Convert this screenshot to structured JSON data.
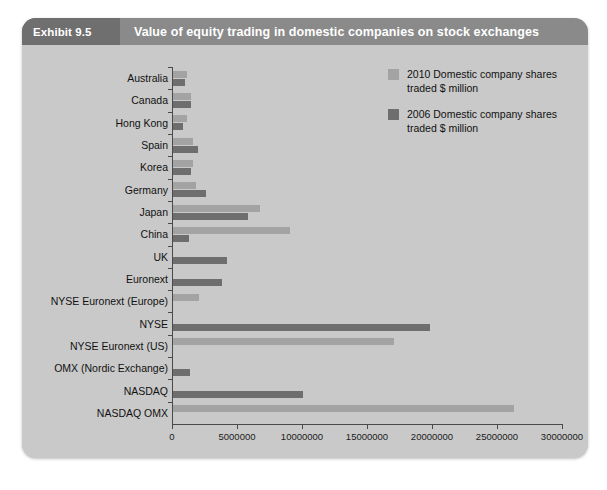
{
  "header": {
    "exhibit_label": "Exhibit 9.5",
    "title": "Value of equity trading in domestic companies on stock exchanges"
  },
  "legend": {
    "position": "top-right",
    "items": [
      {
        "label": "2010 Domestic company shares traded $ million",
        "color": "#a3a3a3"
      },
      {
        "label": "2006 Domestic company shares traded $ million",
        "color": "#6e6e6e"
      }
    ]
  },
  "axis": {
    "x_ticks": [
      "0",
      "5000000",
      "10000000",
      "15000000",
      "20000000",
      "25000000",
      "30000000"
    ],
    "x_tick_values": [
      0,
      5000000,
      10000000,
      15000000,
      20000000,
      25000000,
      30000000
    ]
  },
  "chart_data": {
    "type": "bar",
    "orientation": "horizontal",
    "title": "Value of equity trading in domestic companies on stock exchanges",
    "xlabel": "",
    "ylabel": "",
    "xlim": [
      0,
      30000000
    ],
    "grid": false,
    "legend_position": "top-right",
    "categories": [
      "Australia",
      "Canada",
      "Hong Kong",
      "Spain",
      "Korea",
      "Germany",
      "Japan",
      "China",
      "UK",
      "Euronext",
      "NYSE Euronext (Europe)",
      "NYSE",
      "NYSE Euronext (US)",
      "OMX (Nordic Exchange)",
      "NASDAQ",
      "NASDAQ OMX"
    ],
    "series": [
      {
        "name": "2010 Domestic company shares traded $ million",
        "color": "#a3a3a3",
        "values": [
          1100000,
          1350000,
          1100000,
          1550000,
          1500000,
          1800000,
          6700000,
          9000000,
          0,
          0,
          2000000,
          0,
          17000000,
          0,
          0,
          26200000
        ]
      },
      {
        "name": "2006 Domestic company shares traded $ million",
        "color": "#6e6e6e",
        "values": [
          950000,
          1400000,
          800000,
          1950000,
          1400000,
          2550000,
          5750000,
          1200000,
          4150000,
          3750000,
          0,
          19800000,
          0,
          1300000,
          10000000,
          0
        ]
      }
    ]
  }
}
